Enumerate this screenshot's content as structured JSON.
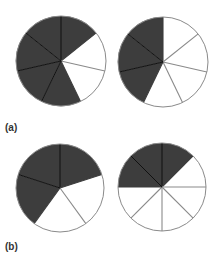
{
  "figure": {
    "panels": [
      {
        "label": "(a)",
        "pies": [
          {
            "cx": 61,
            "cy": 61,
            "r": 45,
            "sectors": 7,
            "shaded": [
              0,
              3,
              4,
              5,
              6
            ]
          },
          {
            "cx": 163,
            "cy": 62,
            "r": 45,
            "sectors": 7,
            "shaded": [
              4,
              5,
              6
            ]
          }
        ]
      },
      {
        "label": "(b)",
        "pies": [
          {
            "cx": 60,
            "cy": 188,
            "r": 44,
            "sectors": 5,
            "shaded": [
              0,
              3,
              4
            ]
          },
          {
            "cx": 162,
            "cy": 187,
            "r": 44,
            "sectors": 8,
            "shaded": [
              0,
              6,
              7
            ]
          }
        ]
      }
    ]
  },
  "colors": {
    "shade": "#3d3d3d",
    "background": "#ffffff",
    "outline": "#8a8a8a",
    "shaded_divider": "#111111"
  }
}
